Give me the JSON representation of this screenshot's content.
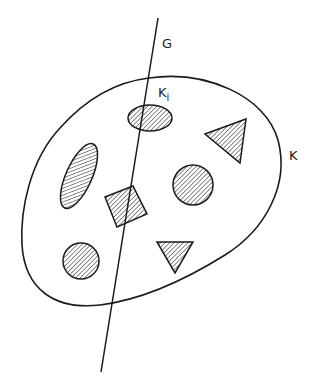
{
  "diagram": {
    "type": "set-illustration",
    "labels": {
      "line": "G",
      "region": "K",
      "subregion_main": "K",
      "subregion_sub": "i"
    },
    "elements": [
      {
        "kind": "region-boundary",
        "name": "K"
      },
      {
        "kind": "line",
        "name": "G"
      },
      {
        "kind": "ellipse",
        "name": "K_i",
        "hatched": true,
        "intersects_G": true
      },
      {
        "kind": "triangle",
        "orientation": "pointing-left",
        "hatched": true
      },
      {
        "kind": "elongated-ellipse",
        "orientation": "tilted",
        "hatched": true
      },
      {
        "kind": "square",
        "orientation": "rotated",
        "hatched": true,
        "intersects_G": true
      },
      {
        "kind": "circle",
        "position": "center-right",
        "hatched": true
      },
      {
        "kind": "circle",
        "position": "lower-left",
        "hatched": true
      },
      {
        "kind": "triangle",
        "orientation": "pointing-down",
        "hatched": true
      }
    ],
    "colors": {
      "stroke": "#1a1a1a",
      "background": "#ffffff"
    }
  }
}
